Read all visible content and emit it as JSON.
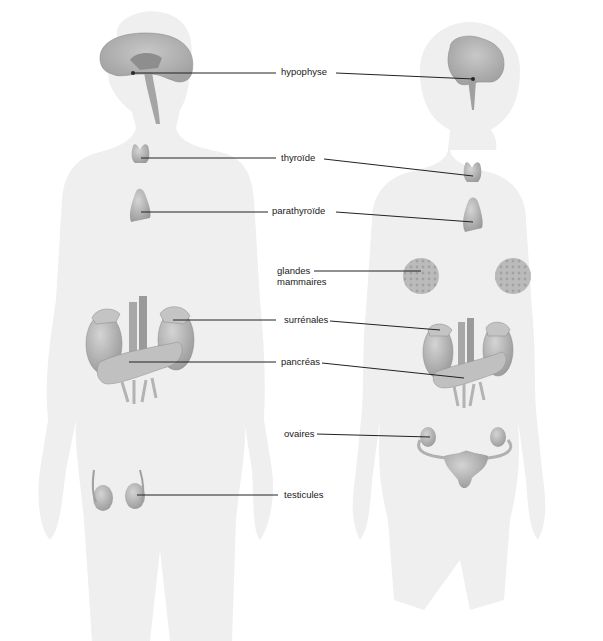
{
  "diagram": {
    "type": "labeled anatomical illustration",
    "figures": [
      {
        "id": "male",
        "side": "left",
        "organs": [
          "hypophyse",
          "thyroïde",
          "parathyroïde",
          "surrénales",
          "pancréas",
          "testicules"
        ]
      },
      {
        "id": "female",
        "side": "right",
        "organs": [
          "hypophyse",
          "thyroïde",
          "parathyroïde",
          "glandes mammaires",
          "surrénales",
          "pancréas",
          "ovaires"
        ]
      }
    ],
    "colors": {
      "background": "#ffffff",
      "body_silhouette": "#efefef",
      "organ_fill": "#b8b8b8",
      "organ_dark": "#8c8c8c",
      "leader_line": "#222222",
      "label_text": "#1a1a1a"
    }
  },
  "labels": {
    "hypophyse": "hypophyse",
    "thyroide": "thyroïde",
    "parathyroide": "parathyroïde",
    "glandes_mammaires": "glandes\nmammaires",
    "surrenales": "surrénales",
    "pancreas": "pancréas",
    "ovaires": "ovaires",
    "testicules": "testicules"
  }
}
